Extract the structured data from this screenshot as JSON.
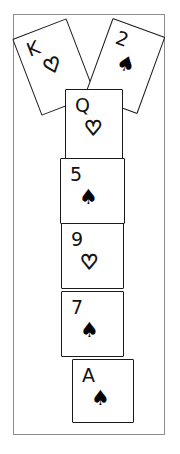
{
  "scene": {
    "title": "Playing card stack illustration",
    "background_color": "#ffffff",
    "frame_border_color": "#8d8d8d",
    "card_border_color": "#1a1a1a",
    "ink_color": "#000000"
  },
  "cards": [
    {
      "id": "card-king-hearts",
      "name": "king-of-hearts",
      "rank": "K",
      "suit": "hearts",
      "suit_glyph": "♡",
      "suit_filled": false,
      "rotation_deg": -21,
      "left": 24,
      "top": 25,
      "width": 58,
      "height": 82,
      "z": 1
    },
    {
      "id": "card-two-spades",
      "name": "two-of-spades",
      "rank": "2",
      "suit": "spades",
      "suit_glyph": "♠",
      "suit_filled": true,
      "rotation_deg": 20,
      "left": 96,
      "top": 24,
      "width": 56,
      "height": 82,
      "z": 2
    },
    {
      "id": "card-queen-hearts",
      "name": "queen-of-hearts",
      "rank": "Q",
      "suit": "hearts",
      "suit_glyph": "♡",
      "suit_filled": false,
      "rotation_deg": 0,
      "left": 64,
      "top": 88,
      "width": 58,
      "height": 72,
      "z": 3
    },
    {
      "id": "card-five-spades",
      "name": "five-of-spades",
      "rank": "5",
      "suit": "spades",
      "suit_glyph": "♠",
      "suit_filled": true,
      "rotation_deg": 0,
      "left": 59,
      "top": 157,
      "width": 65,
      "height": 66,
      "z": 4
    },
    {
      "id": "card-nine-hearts",
      "name": "nine-of-hearts",
      "rank": "9",
      "suit": "hearts",
      "suit_glyph": "♡",
      "suit_filled": false,
      "rotation_deg": 0,
      "left": 60,
      "top": 222,
      "width": 63,
      "height": 66,
      "z": 5
    },
    {
      "id": "card-seven-spades",
      "name": "seven-of-spades",
      "rank": "7",
      "suit": "spades",
      "suit_glyph": "♠",
      "suit_filled": true,
      "rotation_deg": 0,
      "left": 60,
      "top": 290,
      "width": 63,
      "height": 66,
      "z": 6
    },
    {
      "id": "card-ace-spades",
      "name": "ace-of-spades",
      "rank": "A",
      "suit": "spades",
      "suit_glyph": "♠",
      "suit_filled": true,
      "rotation_deg": 0,
      "left": 71,
      "top": 358,
      "width": 62,
      "height": 64,
      "z": 7
    }
  ]
}
